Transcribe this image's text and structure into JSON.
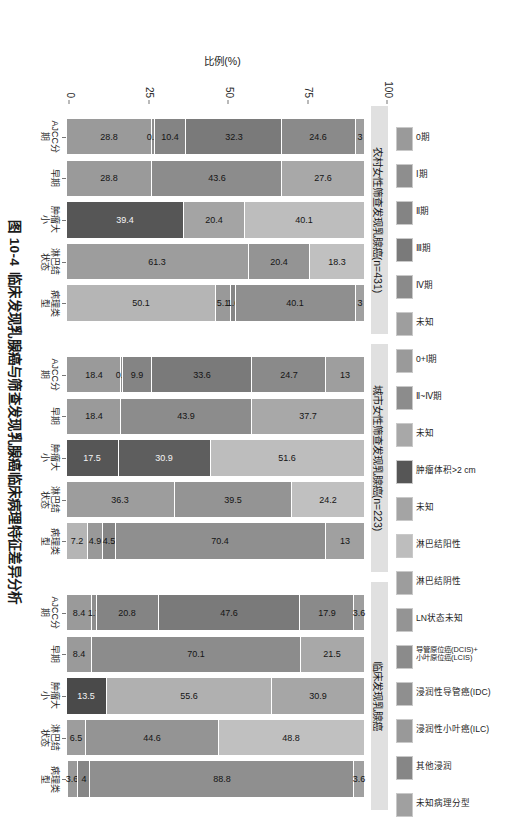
{
  "caption": {
    "number": "图 10-4",
    "text": "临床发现乳腺癌与筛查发现乳腺癌临床病理特征差异分析"
  },
  "axis": {
    "y_title": "比例(%)",
    "y_ticks": [
      "100",
      "75",
      "50",
      "25",
      "0"
    ]
  },
  "legend": {
    "items": [
      {
        "label": "0期",
        "color": "#9a9a9a",
        "pattern": "none"
      },
      {
        "label": "Ⅰ期",
        "color": "#8e8e8e",
        "pattern": "none"
      },
      {
        "label": "Ⅱ期",
        "color": "#848484",
        "pattern": "none"
      },
      {
        "label": "Ⅲ期",
        "color": "#7a7a7a",
        "pattern": "hatch-wave"
      },
      {
        "label": "Ⅳ期",
        "color": "#8a8a8a",
        "pattern": "none"
      },
      {
        "label": "未知",
        "color": "#9e9e9e",
        "pattern": "none"
      },
      {
        "label": "0+Ⅰ期",
        "color": "#9a9a9a",
        "pattern": "none"
      },
      {
        "label": "Ⅱ~Ⅳ期",
        "color": "#8c8c8c",
        "pattern": "none"
      },
      {
        "label": "未知",
        "color": "#a8a8a8",
        "pattern": "none"
      },
      {
        "label": "肿瘤体积>2 cm",
        "color": "#565656",
        "pattern": "hatch-cross"
      },
      {
        "label": "未知",
        "color": "#a4a4a4",
        "pattern": "none"
      },
      {
        "label": "淋巴结阳性",
        "color": "#bdbdbd",
        "pattern": "none"
      },
      {
        "label": "淋巴结阴性",
        "color": "#9d9d9d",
        "pattern": "none"
      },
      {
        "label": "LN状态未知",
        "color": "#949494",
        "pattern": "none"
      },
      {
        "label": "导管原位癌(DCIS)+\n小叶原位癌(LCIS)",
        "color": "#8b8b8b",
        "pattern": "none"
      },
      {
        "label": "浸润性导管癌(IDC)",
        "color": "#8f8f8f",
        "pattern": "none"
      },
      {
        "label": "浸润性小叶癌(ILC)",
        "color": "#999999",
        "pattern": "none"
      },
      {
        "label": "其他浸润",
        "color": "#868686",
        "pattern": "none"
      },
      {
        "label": "未知病理分型",
        "color": "#a0a0a0",
        "pattern": "none"
      }
    ]
  },
  "chart_data": {
    "type": "bar",
    "subtype": "stacked-percent",
    "title": "临床发现乳腺癌与筛查发现乳腺癌临床病理特征差异分析",
    "xlabel": "",
    "ylabel": "比例(%)",
    "ylim": [
      0,
      100
    ],
    "yticks": [
      0,
      25,
      50,
      75,
      100
    ],
    "grid": false,
    "legend_position": "top",
    "categories": [
      "AJCC分期",
      "早期",
      "肿瘤大小",
      "淋巴结\n状态",
      "病理类型"
    ],
    "panels": [
      {
        "title": "农村女性筛查发现乳腺癌(n=431)",
        "groups": [
          {
            "name": "AJCC分期",
            "segments": [
              {
                "label": "0期",
                "value": 28.8,
                "color": "#9a9a9a",
                "pattern": "hatch-diag"
              },
              {
                "label": "Ⅰ期",
                "value": 0.9,
                "color": "#8e8e8e",
                "pattern": "none"
              },
              {
                "label": "Ⅱ期",
                "value": 10.4,
                "color": "#848484",
                "pattern": "none"
              },
              {
                "label": "Ⅲ期",
                "value": 32.3,
                "color": "#7a7a7a",
                "pattern": "hatch-wave"
              },
              {
                "label": "Ⅳ期",
                "value": 24.6,
                "color": "#8a8a8a",
                "pattern": "hatch-diag2"
              },
              {
                "label": "未知",
                "value": 3.0,
                "color": "#9e9e9e",
                "pattern": "none"
              }
            ]
          },
          {
            "name": "早期",
            "segments": [
              {
                "label": "0+Ⅰ期",
                "value": 28.8,
                "color": "#9a9a9a",
                "pattern": "none"
              },
              {
                "label": "Ⅱ~Ⅳ期",
                "value": 43.6,
                "color": "#8c8c8c",
                "pattern": "none"
              },
              {
                "label": "未知",
                "value": 27.6,
                "color": "#a8a8a8",
                "pattern": "none"
              }
            ]
          },
          {
            "name": "肿瘤大小",
            "segments": [
              {
                "label": "肿瘤体积>2 cm",
                "value": 39.4,
                "color": "#565656",
                "pattern": "hatch-cross"
              },
              {
                "label": "未知",
                "value": 20.4,
                "color": "#a4a4a4",
                "pattern": "none"
              },
              {
                "label": "淋巴结阳性",
                "value": 40.1,
                "color": "#bdbdbd",
                "pattern": "none"
              }
            ]
          },
          {
            "name": "淋巴结状态",
            "segments": [
              {
                "label": "淋巴结阴性",
                "value": 61.3,
                "color": "#9d9d9d",
                "pattern": "none"
              },
              {
                "label": "LN状态未知",
                "value": 20.4,
                "color": "#949494",
                "pattern": "none"
              },
              {
                "label": "导管原位癌",
                "value": 18.3,
                "color": "#c0c0c0",
                "pattern": "none"
              }
            ]
          },
          {
            "name": "病理类型",
            "segments": [
              {
                "label": "浸润性导管癌(IDC)",
                "value": 50.1,
                "color": "#b5b5b5",
                "pattern": "none"
              },
              {
                "label": "浸润性小叶癌(ILC)",
                "value": 5.1,
                "color": "#999999",
                "pattern": "none"
              },
              {
                "label": "其他浸润",
                "value": 1.6,
                "color": "#868686",
                "pattern": "none"
              },
              {
                "label": "未知病理分型",
                "value": 40.1,
                "color": "#8f8f8f",
                "pattern": "none"
              },
              {
                "label": "",
                "value": 3.0,
                "color": "#a0a0a0",
                "pattern": "none"
              }
            ]
          }
        ]
      },
      {
        "title": "城市女性筛查发现乳腺癌(n=223)",
        "groups": [
          {
            "name": "AJCC分期",
            "segments": [
              {
                "label": "0期",
                "value": 18.4,
                "color": "#9a9a9a",
                "pattern": "hatch-diag"
              },
              {
                "label": "Ⅰ期",
                "value": 0.4,
                "color": "#8e8e8e",
                "pattern": "none"
              },
              {
                "label": "Ⅱ期",
                "value": 9.9,
                "color": "#848484",
                "pattern": "none"
              },
              {
                "label": "Ⅲ期",
                "value": 33.6,
                "color": "#7a7a7a",
                "pattern": "hatch-wave"
              },
              {
                "label": "Ⅳ期",
                "value": 24.7,
                "color": "#8a8a8a",
                "pattern": "hatch-diag2"
              },
              {
                "label": "未知",
                "value": 13.0,
                "color": "#9e9e9e",
                "pattern": "none"
              }
            ]
          },
          {
            "name": "早期",
            "segments": [
              {
                "label": "0+Ⅰ期",
                "value": 18.4,
                "color": "#9a9a9a",
                "pattern": "none"
              },
              {
                "label": "Ⅱ~Ⅳ期",
                "value": 43.9,
                "color": "#8c8c8c",
                "pattern": "none"
              },
              {
                "label": "未知",
                "value": 37.7,
                "color": "#a8a8a8",
                "pattern": "none"
              }
            ]
          },
          {
            "name": "肿瘤大小",
            "segments": [
              {
                "label": "肿瘤体积>2 cm",
                "value": 17.5,
                "color": "#565656",
                "pattern": "hatch-cross"
              },
              {
                "label": "未知",
                "value": 30.9,
                "color": "#5e5e5e",
                "pattern": "hatch-cross"
              },
              {
                "label": "淋巴结阳性",
                "value": 51.6,
                "color": "#bdbdbd",
                "pattern": "none"
              }
            ]
          },
          {
            "name": "淋巴结状态",
            "segments": [
              {
                "label": "淋巴结阴性",
                "value": 36.3,
                "color": "#9d9d9d",
                "pattern": "none"
              },
              {
                "label": "LN状态未知",
                "value": 39.5,
                "color": "#949494",
                "pattern": "none"
              },
              {
                "label": "导管原位癌",
                "value": 24.2,
                "color": "#c0c0c0",
                "pattern": "none"
              }
            ]
          },
          {
            "name": "病理类型",
            "segments": [
              {
                "label": "浸润性导管癌(IDC)",
                "value": 7.2,
                "color": "#b5b5b5",
                "pattern": "none"
              },
              {
                "label": "浸润性小叶癌(ILC)",
                "value": 4.9,
                "color": "#999999",
                "pattern": "none"
              },
              {
                "label": "其他浸润",
                "value": 4.5,
                "color": "#868686",
                "pattern": "none"
              },
              {
                "label": "未知病理分型",
                "value": 70.4,
                "color": "#8f8f8f",
                "pattern": "none"
              },
              {
                "label": "",
                "value": 13.0,
                "color": "#a0a0a0",
                "pattern": "none"
              }
            ]
          }
        ]
      },
      {
        "title": "临床发现乳腺癌",
        "groups": [
          {
            "name": "AJCC分期",
            "segments": [
              {
                "label": "0期",
                "value": 8.4,
                "color": "#9a9a9a",
                "pattern": "hatch-diag"
              },
              {
                "label": "Ⅰ期",
                "value": 1.7,
                "color": "#8e8e8e",
                "pattern": "none"
              },
              {
                "label": "Ⅱ期",
                "value": 20.8,
                "color": "#848484",
                "pattern": "none"
              },
              {
                "label": "Ⅲ期",
                "value": 47.6,
                "color": "#7a7a7a",
                "pattern": "hatch-wave"
              },
              {
                "label": "Ⅳ期",
                "value": 17.9,
                "color": "#8a8a8a",
                "pattern": "hatch-diag2"
              },
              {
                "label": "未知",
                "value": 3.6,
                "color": "#9e9e9e",
                "pattern": "none"
              }
            ]
          },
          {
            "name": "早期",
            "segments": [
              {
                "label": "0+Ⅰ期",
                "value": 8.4,
                "color": "#9a9a9a",
                "pattern": "none"
              },
              {
                "label": "Ⅱ~Ⅳ期",
                "value": 70.1,
                "color": "#8c8c8c",
                "pattern": "none"
              },
              {
                "label": "未知",
                "value": 21.5,
                "color": "#a8a8a8",
                "pattern": "none"
              }
            ]
          },
          {
            "name": "肿瘤大小",
            "segments": [
              {
                "label": "肿瘤体积>2 cm",
                "value": 13.5,
                "color": "#4a4a4a",
                "pattern": "hatch-cross"
              },
              {
                "label": "未知",
                "value": 55.6,
                "color": "#b0b0b0",
                "pattern": "none"
              },
              {
                "label": "淋巴结阳性",
                "value": 30.9,
                "color": "#a6a6a6",
                "pattern": "none"
              }
            ]
          },
          {
            "name": "淋巴结状态",
            "segments": [
              {
                "label": "淋巴结阴性",
                "value": 6.5,
                "color": "#9d9d9d",
                "pattern": "none"
              },
              {
                "label": "LN状态未知",
                "value": 44.6,
                "color": "#949494",
                "pattern": "none"
              },
              {
                "label": "导管原位癌",
                "value": 48.8,
                "color": "#c0c0c0",
                "pattern": "none"
              }
            ]
          },
          {
            "name": "病理类型",
            "segments": [
              {
                "label": "浸润性导管癌(IDC)",
                "value": 0.0,
                "color": "#b5b5b5",
                "pattern": "none"
              },
              {
                "label": "浸润性小叶癌(ILC)",
                "value": 3.6,
                "color": "#999999",
                "pattern": "none"
              },
              {
                "label": "其他浸润",
                "value": 4.0,
                "color": "#868686",
                "pattern": "none"
              },
              {
                "label": "未知病理分型",
                "value": 88.8,
                "color": "#8f8f8f",
                "pattern": "none"
              },
              {
                "label": "",
                "value": 3.6,
                "color": "#a0a0a0",
                "pattern": "none"
              }
            ]
          }
        ]
      }
    ]
  }
}
